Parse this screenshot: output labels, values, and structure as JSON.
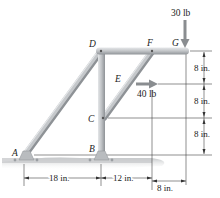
{
  "diagram": {
    "type": "frame-structure",
    "points": {
      "A": {
        "label": "A"
      },
      "B": {
        "label": "B"
      },
      "C": {
        "label": "C"
      },
      "D": {
        "label": "D"
      },
      "E": {
        "label": "E"
      },
      "F": {
        "label": "F"
      },
      "G": {
        "label": "G"
      }
    },
    "loads": [
      {
        "id": "load-g",
        "label": "30 lb",
        "direction": "down",
        "at": "G"
      },
      {
        "id": "load-e",
        "label": "40 lb",
        "direction": "right",
        "at": "E"
      }
    ],
    "dimensions": {
      "horizontal": [
        {
          "label": "18 in.",
          "from": "A",
          "to": "B"
        },
        {
          "label": "12 in.",
          "from": "B",
          "to": "F-line"
        },
        {
          "label": "8 in.",
          "from": "F-line",
          "to": "G"
        }
      ],
      "vertical": [
        {
          "label": "8 in.",
          "from": "G",
          "to": "E"
        },
        {
          "label": "8 in.",
          "from": "E",
          "to": "C"
        },
        {
          "label": "8 in.",
          "from": "C",
          "to": "B"
        }
      ]
    },
    "colors": {
      "member": "#b9bcbf",
      "member_highlight": "#e4e6e8",
      "member_shadow": "#8e9296",
      "ground": "#c6c8ca",
      "arrow": "#8a8d90",
      "line": "#333333"
    }
  }
}
